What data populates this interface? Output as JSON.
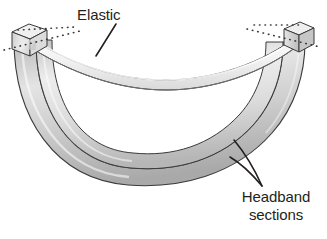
{
  "figure": {
    "type": "technical-line-illustration",
    "background_color": "#ffffff",
    "ink_color": "#231f20",
    "outline_color": "#3a3a3a"
  },
  "labels": {
    "elastic": {
      "text": "Elastic",
      "leader": "line from label down-left to upper elastic band"
    },
    "headband": {
      "line1": "Headband",
      "line2": "sections",
      "leader": "two lines from label up-left to the two curved band sections"
    }
  },
  "parts": {
    "elastic_band": {
      "name": "Elastic",
      "fill": "#f2f2f2",
      "description": "light narrow strip spanning the top between the two end caps"
    },
    "headband_outer": {
      "name": "Headband section (outer)",
      "fill": "#c9c9c9",
      "description": "outer U-shaped curved band"
    },
    "headband_inner": {
      "name": "Headband section (inner)",
      "fill": "#d9d9d9",
      "description": "inner U-shaped curved band adjacent to outer"
    },
    "end_cap_left": {
      "name": "Left end cap",
      "fill": "#e0e0e0"
    },
    "end_cap_right": {
      "name": "Right end cap",
      "fill": "#d2d2d2"
    },
    "construction_lines": {
      "name": "Dotted construction lines",
      "style": "dotted",
      "color": "#3a3a3a"
    }
  },
  "colors": {
    "ink": "#231f20",
    "stroke": "#3a3a3a",
    "light_gray": "#f2f2f2",
    "mid_gray": "#d9d9d9",
    "dark_gray": "#b4b4b4"
  }
}
